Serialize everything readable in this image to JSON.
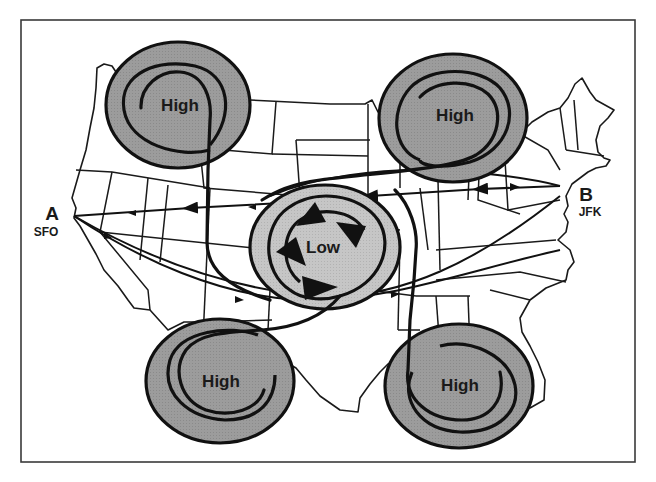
{
  "diagram": {
    "type": "weather-pressure-systems-flight-routes",
    "colors": {
      "high_fill": "#9a9a9a",
      "low_fill": "#c4c4c4",
      "line": "#111111",
      "background": "#ffffff"
    },
    "endpoints": {
      "a": {
        "letter": "A",
        "code": "SFO"
      },
      "b": {
        "letter": "B",
        "code": "JFK"
      }
    },
    "systems": {
      "high_nw": {
        "label": "High"
      },
      "high_ne": {
        "label": "High"
      },
      "high_sw": {
        "label": "High"
      },
      "high_se": {
        "label": "High"
      },
      "low_center": {
        "label": "Low"
      }
    },
    "routes": [
      {
        "name": "great-circle-direct",
        "from": "JFK",
        "to": "SFO"
      },
      {
        "name": "southern-route",
        "from": "SFO",
        "to": "JFK"
      },
      {
        "name": "flow-around-low-route",
        "from": "SFO",
        "to": "JFK"
      }
    ]
  }
}
